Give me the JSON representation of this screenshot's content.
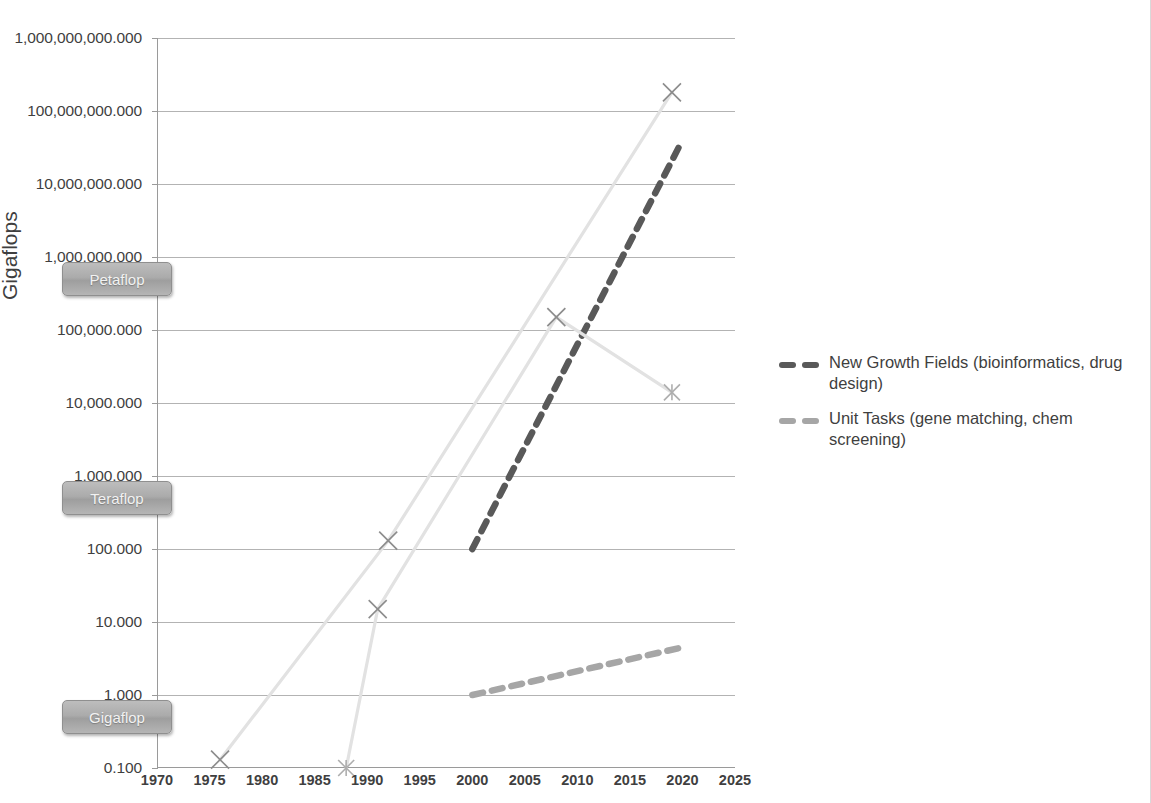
{
  "chart_data": {
    "type": "line",
    "title": "",
    "xlabel": "",
    "ylabel": "Gigaflops",
    "yscale": "log",
    "ylim": [
      0.1,
      1000000000.0
    ],
    "xlim": [
      1970,
      2025
    ],
    "grid": true,
    "legend_position": "right",
    "y_tick_labels": [
      "1,000,000,000.000",
      "100,000,000.000",
      "10,000,000.000",
      "1,000,000.000",
      "100,000.000",
      "10,000.000",
      "1,000.000",
      "100.000",
      "10.000",
      "1.000",
      "0.100"
    ],
    "y_tick_values": [
      1000000000,
      100000000,
      10000000,
      1000000,
      100000,
      10000,
      1000,
      100,
      10,
      1,
      0.1
    ],
    "x_tick_labels": [
      "1970",
      "1975",
      "1980",
      "1985",
      "1990",
      "1995",
      "2000",
      "2005",
      "2010",
      "2015",
      "2020",
      "2025"
    ],
    "x_tick_values": [
      1970,
      1975,
      1980,
      1985,
      1990,
      1995,
      2000,
      2005,
      2010,
      2015,
      2020,
      2025
    ],
    "annotations": [
      {
        "label": "Petaflop",
        "y_value": 1000000,
        "note": "milestone badge on y axis"
      },
      {
        "label": "Teraflop",
        "y_value": 1000,
        "note": "milestone badge on y axis"
      },
      {
        "label": "Gigaflop",
        "y_value": 1,
        "note": "milestone badge on y axis"
      }
    ],
    "series": [
      {
        "name": "New Growth Fields (bioinformatics, drug design)",
        "style": "dashed",
        "color": "#595959",
        "x": [
          2000,
          2020
        ],
        "y": [
          100,
          40000000
        ],
        "marker": "none"
      },
      {
        "name": "Unit Tasks (gene matching, chem screening)",
        "style": "dashed",
        "color": "#a6a6a6",
        "x": [
          2000,
          2020
        ],
        "y": [
          1.0,
          4.5
        ],
        "marker": "none"
      },
      {
        "name": "Historical trend A (markers: x)",
        "style": "solid-faint",
        "color": "#e2e2e2",
        "x": [
          1976,
          1992,
          2019
        ],
        "y": [
          0.13,
          130,
          180000000
        ],
        "marker": "x"
      },
      {
        "name": "Historical trend B (markers: x / asterisk)",
        "style": "solid-faint",
        "color": "#e2e2e2",
        "x": [
          1988,
          1991,
          2008,
          2019
        ],
        "y": [
          0.1,
          15,
          150000,
          14000
        ],
        "marker": "asterisk"
      }
    ],
    "data_markers": [
      {
        "x": 1976,
        "y": 0.13,
        "marker": "x"
      },
      {
        "x": 1988,
        "y": 0.1,
        "marker": "asterisk"
      },
      {
        "x": 1991,
        "y": 15,
        "marker": "x"
      },
      {
        "x": 1992,
        "y": 130,
        "marker": "x"
      },
      {
        "x": 2008,
        "y": 150000,
        "marker": "x"
      },
      {
        "x": 2019,
        "y": 14000,
        "marker": "asterisk"
      },
      {
        "x": 2019,
        "y": 180000000,
        "marker": "x"
      }
    ]
  },
  "axis": {
    "y_title": "Gigaflops"
  },
  "badges": {
    "petaflop": "Petaflop",
    "teraflop": "Teraflop",
    "gigaflop": "Gigaflop"
  },
  "legend": {
    "items": [
      {
        "label": "New Growth Fields (bioinformatics, drug design)",
        "color": "#595959"
      },
      {
        "label": "Unit Tasks (gene matching, chem screening)",
        "color": "#a6a6a6"
      }
    ]
  }
}
